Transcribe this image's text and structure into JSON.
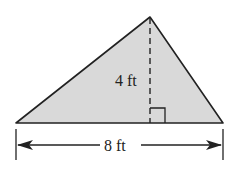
{
  "figure": {
    "shape": "triangle",
    "fill_color": "#d9d9d9",
    "stroke_color": "#222222",
    "height_label": "4 ft",
    "base_label": "8 ft",
    "height_marker": "dashed-altitude",
    "right_angle_marker": true
  }
}
